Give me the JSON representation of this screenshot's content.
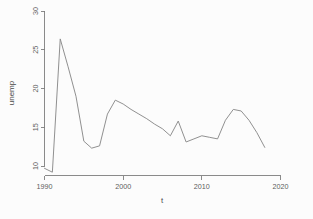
{
  "chart_data": {
    "type": "line",
    "title": "",
    "xlabel": "t",
    "ylabel": "unemp",
    "xlim": [
      1989.2,
      2021.5
    ],
    "ylim": [
      8.6,
      30.8
    ],
    "grid": false,
    "legend": null,
    "xticks": [
      1990,
      2000,
      2010,
      2020
    ],
    "xtick_labels": [
      "1990",
      "2000",
      "2010",
      "2020"
    ],
    "yticks": [
      10,
      15,
      20,
      25,
      30
    ],
    "ytick_labels": [
      "10",
      "15",
      "20",
      "25",
      "30"
    ],
    "series": [
      {
        "name": "unemp",
        "color": "#8a8a8a",
        "x": [
          1990,
          1991,
          1992,
          1993,
          1994,
          1995,
          1996,
          1997,
          1998,
          1999,
          2000,
          2001,
          2002,
          2003,
          2004,
          2005,
          2006,
          2007,
          2008,
          2009,
          2010,
          2011,
          2012,
          2013,
          2014,
          2015,
          2016,
          2017,
          2018
        ],
        "values": [
          9.7,
          9.2,
          26.4,
          22.8,
          19.0,
          13.2,
          12.3,
          12.6,
          16.7,
          18.5,
          18.0,
          17.3,
          16.7,
          16.1,
          15.4,
          14.8,
          13.9,
          15.8,
          13.1,
          13.5,
          13.9,
          13.7,
          13.5,
          15.9,
          17.3,
          17.1,
          15.9,
          14.3,
          12.4
        ]
      }
    ]
  },
  "axes": {
    "x_title": "t",
    "y_title": "unemp"
  }
}
